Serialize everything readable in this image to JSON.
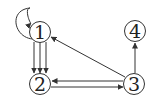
{
  "diagram": {
    "type": "directed-multigraph",
    "stroke_color": "#333333",
    "background": "#ffffff",
    "nodes": [
      {
        "id": "1",
        "label": "1",
        "x": 40,
        "y": 32
      },
      {
        "id": "2",
        "label": "2",
        "x": 40,
        "y": 84
      },
      {
        "id": "3",
        "label": "3",
        "x": 134,
        "y": 84
      },
      {
        "id": "4",
        "label": "4",
        "x": 135,
        "y": 31
      }
    ],
    "edges": [
      {
        "from": "1",
        "to": "1",
        "kind": "self-loop"
      },
      {
        "from": "1",
        "to": "2",
        "count": 3
      },
      {
        "from": "3",
        "to": "2"
      },
      {
        "from": "2",
        "to": "3"
      },
      {
        "from": "3",
        "to": "1"
      },
      {
        "from": "3",
        "to": "4"
      }
    ]
  }
}
